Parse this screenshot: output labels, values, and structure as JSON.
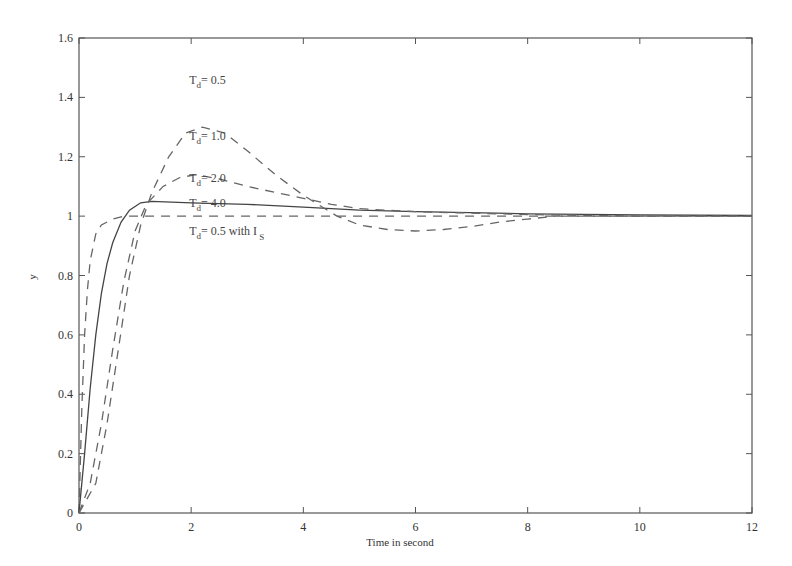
{
  "chart_data": {
    "type": "line",
    "title": "",
    "xlabel": "Time in second",
    "ylabel": "y",
    "xlim": [
      0,
      12
    ],
    "ylim": [
      0,
      1.6
    ],
    "xticks": [
      0,
      2,
      4,
      6,
      8,
      10,
      12
    ],
    "xtick_labels": [
      "0",
      "2",
      "4",
      "6",
      "8",
      "10",
      "12"
    ],
    "yticks": [
      0,
      0.2,
      0.4,
      0.6,
      0.8,
      1,
      1.2,
      1.4,
      1.6
    ],
    "ytick_labels": [
      "0",
      "0.2",
      "0.4",
      "0.6",
      "0.8",
      "1",
      "1.2",
      "1.4",
      "1.6"
    ],
    "grid": false,
    "legend": "inline annotations",
    "series": [
      {
        "name": "Td = 0.5 with Is",
        "style": "dashed",
        "x": [
          0,
          0.05,
          0.1,
          0.15,
          0.2,
          0.3,
          0.4,
          0.6,
          0.8,
          1.0,
          2,
          4,
          6,
          8,
          10,
          12
        ],
        "y": [
          0,
          0.35,
          0.6,
          0.75,
          0.85,
          0.94,
          0.97,
          0.99,
          1.0,
          1.0,
          1.0,
          1.0,
          1.0,
          1.0,
          1.0,
          1.0
        ]
      },
      {
        "name": "Td = 4.0",
        "style": "solid",
        "x": [
          0,
          0.1,
          0.2,
          0.3,
          0.4,
          0.5,
          0.6,
          0.75,
          0.9,
          1.1,
          1.3,
          2,
          3,
          4,
          5,
          6,
          8,
          10,
          12
        ],
        "y": [
          0,
          0.2,
          0.42,
          0.6,
          0.74,
          0.84,
          0.91,
          0.98,
          1.02,
          1.045,
          1.05,
          1.045,
          1.04,
          1.03,
          1.02,
          1.015,
          1.008,
          1.004,
          1.002
        ]
      },
      {
        "name": "Td = 2.0",
        "style": "dashed",
        "x": [
          0,
          0.2,
          0.4,
          0.6,
          0.8,
          1.0,
          1.2,
          1.5,
          1.8,
          2.1,
          2.5,
          3,
          3.5,
          4,
          4.5,
          5,
          6,
          8,
          10,
          12
        ],
        "y": [
          0,
          0.1,
          0.3,
          0.55,
          0.78,
          0.95,
          1.04,
          1.1,
          1.13,
          1.14,
          1.125,
          1.1,
          1.08,
          1.06,
          1.04,
          1.025,
          1.015,
          1.005,
          1.0,
          1.0
        ]
      },
      {
        "name": "Td = 1.0",
        "style": "dashed",
        "x": [
          0,
          0.3,
          0.5,
          0.7,
          0.9,
          1.1,
          1.3,
          1.6,
          1.9,
          2.2,
          2.6,
          3,
          3.5,
          4,
          4.6,
          5,
          5.5,
          6,
          6.5,
          7,
          7.5,
          8,
          8.5,
          10,
          12
        ],
        "y": [
          0,
          0.1,
          0.3,
          0.55,
          0.8,
          0.97,
          1.08,
          1.2,
          1.28,
          1.3,
          1.28,
          1.22,
          1.14,
          1.07,
          1.0,
          0.97,
          0.955,
          0.95,
          0.955,
          0.965,
          0.98,
          0.99,
          1.0,
          1.0,
          1.0
        ]
      }
    ],
    "annotations": [
      {
        "text_main": "T",
        "sub": "d",
        "rest": "= 0.5",
        "x": 2.0,
        "y": 1.46
      },
      {
        "text_main": "T",
        "sub": "d",
        "rest": "= 1.0",
        "x": 2.0,
        "y": 1.27
      },
      {
        "text_main": "T",
        "sub": "d",
        "rest": "= 2.0",
        "x": 2.0,
        "y": 1.13
      },
      {
        "text_main": "T",
        "sub": "d",
        "rest": "= 4.0",
        "x": 2.0,
        "y": 1.045
      },
      {
        "text_main": "T",
        "sub": "d",
        "rest": "= 0.5  with I",
        "sub2": "S",
        "x": 2.0,
        "y": 0.95
      }
    ]
  }
}
